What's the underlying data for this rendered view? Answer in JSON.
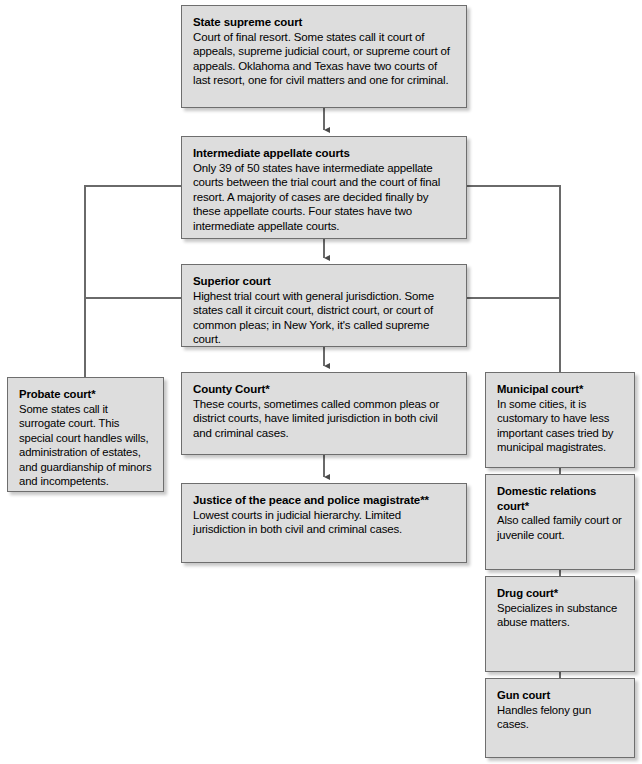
{
  "diagram": {
    "type": "organizational-flowchart",
    "background_color": "#ffffff",
    "box_fill_color": "#dddddd",
    "box_border_color": "#6e6e6e",
    "connector_color": "#555555"
  },
  "nodes": {
    "state_supreme_court": {
      "title": "State supreme court",
      "desc": "Court of final resort. Some states call it court of appeals, supreme judicial court, or supreme court of appeals. Oklahoma and Texas have two courts of last resort, one for civil matters and one for criminal."
    },
    "intermediate_appellate_courts": {
      "title": "Intermediate appellate courts",
      "desc": "Only 39 of 50 states have intermediate appellate courts between the trial court and the court of final resort. A majority of cases are decided finally by these appellate courts. Four states have two intermediate appellate courts."
    },
    "superior_court": {
      "title": "Superior court",
      "desc": "Highest trial court with general jurisdiction. Some states call it circuit court, district court, or court of common pleas; in New York, it's called supreme court."
    },
    "probate_court": {
      "title": "Probate court*",
      "desc": "Some states call it surrogate court. This special court handles wills, administration of estates, and guardianship of minors and incompetents."
    },
    "county_court": {
      "title": "County Court*",
      "desc": "These courts, sometimes called common pleas or district courts, have limited jurisdiction in both civil and criminal cases."
    },
    "justice_of_the_peace": {
      "title": "Justice of the peace and police magistrate**",
      "desc": "Lowest courts in judicial hierarchy. Limited jurisdiction in both civil and criminal cases."
    },
    "municipal_court": {
      "title": "Municipal court*",
      "desc": "In some cities, it is customary to have less important cases tried by municipal magistrates."
    },
    "domestic_relations_court": {
      "title": "Domestic relations court*",
      "desc": "Also called family court or juvenile court."
    },
    "drug_court": {
      "title": "Drug court*",
      "desc": "Specializes in substance abuse matters."
    },
    "gun_court": {
      "title": "Gun court",
      "desc": "Handles felony gun cases."
    }
  }
}
